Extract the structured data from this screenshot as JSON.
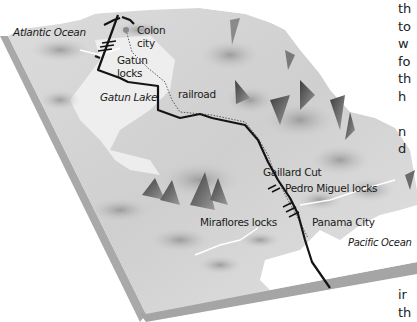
{
  "diagram": {
    "type": "3d-terrain-map",
    "colors": {
      "terrain_light": "#e6e6e6",
      "terrain_mid": "#bdbdbd",
      "terrain_dark": "#5a5a5a",
      "slab_side": "#a8a8a8",
      "canal_line": "#1a1a1a",
      "railroad_line": "#6a6a6a",
      "water": "#ffffff"
    },
    "labels": {
      "atlantic_ocean": "Atlantic Ocean",
      "colon_city": "Colon\ncity",
      "colon_line1": "Colon",
      "colon_line2": "city",
      "gatun_locks_line1": "Gatun",
      "gatun_locks_line2": "locks",
      "gatun_lake": "Gatun Lake",
      "railroad": "railroad",
      "gaillard_cut": "Gaillard Cut",
      "pedro_miguel_locks": "Pedro Miguel locks",
      "miraflores_locks": "Miraflores locks",
      "panama_city": "Panama City",
      "pacific_ocean": "Pacific Ocean"
    },
    "side_text_fragments": [
      "th",
      "to",
      "w",
      "fo",
      "th",
      "h",
      "",
      "n",
      "d"
    ],
    "side_text_bottom": [
      "ir",
      "th"
    ]
  }
}
